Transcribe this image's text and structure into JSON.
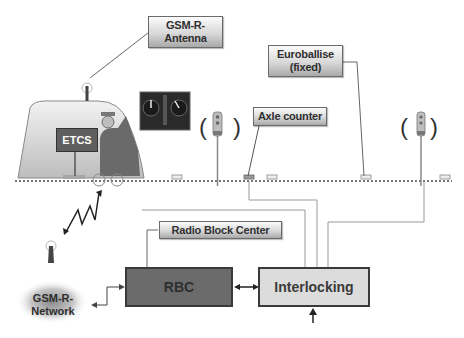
{
  "diagram": {
    "type": "ETCS Level 2 system overview",
    "labels": {
      "gsmr_antenna": [
        "GSM-R-",
        "Antenna"
      ],
      "euroballise": [
        "Euroballise",
        "(fixed)"
      ],
      "axle_counter": "Axle counter",
      "radio_block_center": "Radio Block Center",
      "gsmr_network": [
        "GSM-R-",
        "Network"
      ]
    },
    "blocks": {
      "rbc": "RBC",
      "interlocking": "Interlocking"
    },
    "train": {
      "sign": "ETCS"
    },
    "colors": {
      "rbc_fill": "#6b6b6b",
      "interlocking_fill": "#dcdcdc",
      "train_body": "#d0d0d0",
      "line": "#8a8a8a",
      "track": "#777777"
    }
  }
}
